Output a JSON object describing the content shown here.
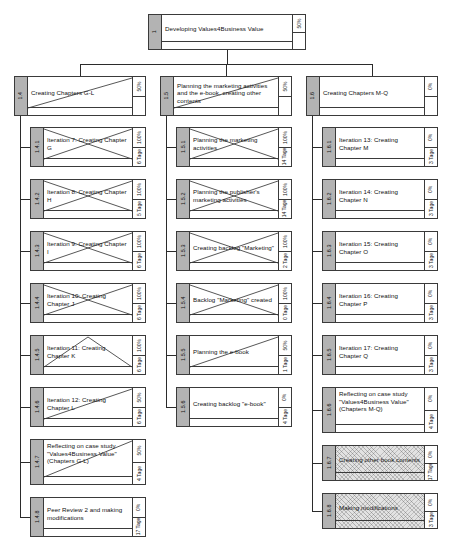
{
  "diagram": {
    "title": "Developing Values4Business Value",
    "type": "work-breakdown-structure",
    "duration_unit": "Tage"
  },
  "root": {
    "id": "1",
    "label": "Developing Values4Business Value",
    "percent": "50%",
    "duration": "",
    "style": "plain"
  },
  "branches": [
    {
      "id": "1.4",
      "label": "Creating Chapters G-L",
      "percent": "50%",
      "duration": "",
      "style": "diag-up",
      "children": [
        {
          "id": "1.4.1",
          "label": "Iteration 7: Creating Chapter G",
          "percent": "100%",
          "duration": "6 Tage",
          "style": "diag-x"
        },
        {
          "id": "1.4.2",
          "label": "Iteration 8: Creating Chapter H",
          "percent": "100%",
          "duration": "5 Tage",
          "style": "diag-x"
        },
        {
          "id": "1.4.3",
          "label": "Iteration 9: Creating Chapter I",
          "percent": "100%",
          "duration": "6 Tage",
          "style": "diag-x"
        },
        {
          "id": "1.4.4",
          "label": "Iteration 10: Creating Chapter J",
          "percent": "100%",
          "duration": "6 Tage",
          "style": "diag-x"
        },
        {
          "id": "1.4.5",
          "label": "Iteration 11: Creating Chapter K",
          "percent": "100%",
          "duration": "6 Tage",
          "style": "diag-tri"
        },
        {
          "id": "1.4.6",
          "label": "Iteration 12: Creating Chapter L",
          "percent": "50%",
          "duration": "6 Tage",
          "style": "diag-up"
        },
        {
          "id": "1.4.7",
          "label": "Reflecting on case study \"Values4Business Value\" (Chapters G-L)",
          "percent": "50%",
          "duration": "4 Tage",
          "style": "diag-up"
        },
        {
          "id": "1.4.8",
          "label": "Peer Review 2 and making modifications",
          "percent": "0%",
          "duration": "17 Tage",
          "style": "plain"
        }
      ]
    },
    {
      "id": "1.5",
      "label": "Planning the marketing activities and the e-book, creating other contents",
      "percent": "50%",
      "duration": "",
      "style": "diag-up",
      "children": [
        {
          "id": "1.5.1",
          "label": "Planning the marketing activities",
          "percent": "100%",
          "duration": "14 Tage",
          "style": "diag-x"
        },
        {
          "id": "1.5.2",
          "label": "Planning the publisher's marketing activities",
          "percent": "100%",
          "duration": "14 Tage",
          "style": "diag-x"
        },
        {
          "id": "1.5.3",
          "label": "Creating backlog \"Marketing\"",
          "percent": "100%",
          "duration": "2 Tage",
          "style": "diag-x"
        },
        {
          "id": "1.5.4",
          "label": "Backlog \"Marketing\" created",
          "percent": "100%",
          "duration": "0 Tage",
          "style": "diag-x"
        },
        {
          "id": "1.5.5",
          "label": "Planning the e-book",
          "percent": "50%",
          "duration": "1 Tage",
          "style": "diag-up"
        },
        {
          "id": "1.5.6",
          "label": "Creating backlog \"e-book\"",
          "percent": "0%",
          "duration": "4 Tage",
          "style": "plain"
        }
      ]
    },
    {
      "id": "1.6",
      "label": "Creating Chapters M-Q",
      "percent": "0%",
      "duration": "",
      "style": "plain",
      "children": [
        {
          "id": "1.6.1",
          "label": "Iteration 13: Creating Chapter M",
          "percent": "0%",
          "duration": "3 Tage",
          "style": "plain"
        },
        {
          "id": "1.6.2",
          "label": "Iteration 14: Creating Chapter N",
          "percent": "0%",
          "duration": "3 Tage",
          "style": "plain"
        },
        {
          "id": "1.6.3",
          "label": "Iteration 15: Creating Chapter O",
          "percent": "0%",
          "duration": "3 Tage",
          "style": "plain"
        },
        {
          "id": "1.6.4",
          "label": "Iteration 16: Creating Chapter P",
          "percent": "0%",
          "duration": "3 Tage",
          "style": "plain"
        },
        {
          "id": "1.6.5",
          "label": "Iteration 17: Creating Chapter Q",
          "percent": "0%",
          "duration": "3 Tage",
          "style": "plain"
        },
        {
          "id": "1.6.6",
          "label": "Reflecting on case study \"Values4Business Value\" (Chapters M-Q)",
          "percent": "0%",
          "duration": "4 Tage",
          "style": "plain"
        },
        {
          "id": "1.6.7",
          "label": "Creating other book contents",
          "percent": "0%",
          "duration": "17 Tage",
          "style": "hatch"
        },
        {
          "id": "1.6.8",
          "label": "Making modifications",
          "percent": "0%",
          "duration": "3 Tage",
          "style": "hatch"
        }
      ]
    }
  ],
  "colors": {
    "id_column": "#b3b3b3",
    "border": "#3a3a3a",
    "node_fill": "#ffffff",
    "hatch_fill": "#e2e2e2",
    "connector": "#2b2b2b"
  }
}
